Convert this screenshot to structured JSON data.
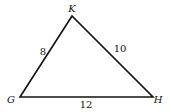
{
  "diagram": {
    "type": "triangle",
    "vertices": [
      {
        "name": "K",
        "x": 72,
        "y": 16,
        "label_x": 72,
        "label_y": 12
      },
      {
        "name": "G",
        "x": 20,
        "y": 97,
        "label_x": 11,
        "label_y": 103
      },
      {
        "name": "H",
        "x": 153,
        "y": 97,
        "label_x": 158,
        "label_y": 103
      }
    ],
    "sides": [
      {
        "between": "GK",
        "length": "8",
        "label_x": 43,
        "label_y": 55
      },
      {
        "between": "KH",
        "length": "10",
        "label_x": 120,
        "label_y": 52
      },
      {
        "between": "GH",
        "length": "12",
        "label_x": 86,
        "label_y": 108
      }
    ],
    "stroke_color": "#111111"
  }
}
